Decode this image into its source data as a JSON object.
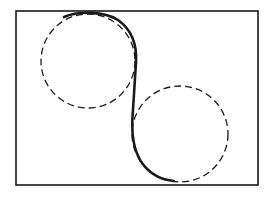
{
  "diagram": {
    "colors": {
      "stroke": "#1a1a1a",
      "background": "#ffffff"
    },
    "frame": {
      "x": 16,
      "y": 11,
      "width": 242,
      "height": 174
    },
    "circles": [
      {
        "name": "upper-left-circle",
        "cx": 88,
        "cy": 61,
        "r": 47,
        "style": "dashed"
      },
      {
        "name": "lower-right-circle",
        "cx": 180,
        "cy": 134,
        "r": 48,
        "style": "dashed"
      }
    ],
    "path": {
      "name": "s-curve-path",
      "style": "solid",
      "d": "M 64 17 C 78 11, 104 11, 118 20 C 132 30, 137 45, 136 62 L 133 110 C 131 130, 133 150, 142 163 C 150 174, 162 180, 174 181"
    }
  }
}
